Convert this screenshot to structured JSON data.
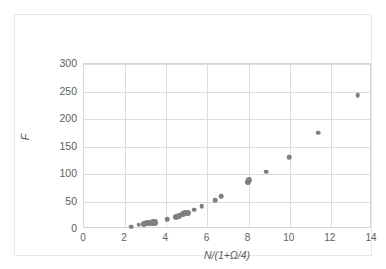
{
  "chart_data": {
    "type": "scatter",
    "title": "",
    "xlabel": "N/(1+Ω/4)",
    "ylabel": "F",
    "xlim": [
      0,
      14
    ],
    "ylim": [
      0,
      300
    ],
    "xticks": [
      0,
      2,
      4,
      6,
      8,
      10,
      12,
      14
    ],
    "yticks": [
      0,
      50,
      100,
      150,
      200,
      250,
      300
    ],
    "grid": true,
    "legend": "none",
    "marker_color": "#7f7f7f",
    "series": [
      {
        "name": "F vs N/(1+Ω/4)",
        "points": [
          {
            "x": 2.3,
            "y": 4
          },
          {
            "x": 2.65,
            "y": 8
          },
          {
            "x": 2.9,
            "y": 9
          },
          {
            "x": 3.05,
            "y": 11
          },
          {
            "x": 3.2,
            "y": 11
          },
          {
            "x": 3.35,
            "y": 12
          },
          {
            "x": 3.45,
            "y": 12
          },
          {
            "x": 4.05,
            "y": 18
          },
          {
            "x": 4.45,
            "y": 22
          },
          {
            "x": 4.62,
            "y": 24
          },
          {
            "x": 4.8,
            "y": 27
          },
          {
            "x": 4.92,
            "y": 29
          },
          {
            "x": 5.05,
            "y": 30
          },
          {
            "x": 5.35,
            "y": 35
          },
          {
            "x": 5.72,
            "y": 41
          },
          {
            "x": 6.38,
            "y": 52
          },
          {
            "x": 6.68,
            "y": 60
          },
          {
            "x": 7.98,
            "y": 85
          },
          {
            "x": 8.02,
            "y": 89
          },
          {
            "x": 8.85,
            "y": 104
          },
          {
            "x": 9.97,
            "y": 131
          },
          {
            "x": 11.38,
            "y": 175
          },
          {
            "x": 13.3,
            "y": 243
          }
        ]
      }
    ]
  },
  "axes": {
    "y_tick_labels": [
      "300",
      "250",
      "200",
      "150",
      "100",
      "50",
      "0"
    ],
    "x_tick_labels": [
      "0",
      "2",
      "4",
      "6",
      "8",
      "10",
      "12",
      "14"
    ],
    "y_title": "F",
    "x_title": "N/(1+Ω/4)"
  },
  "colors": {
    "marker": "#7f7f7f",
    "gridline": "#dcdcdc",
    "plot_border": "#d6d6d6",
    "outer_border": "#e8e8e8",
    "tick_text": "#606060",
    "axis_title_text": "#5a5a5a",
    "background": "#ffffff"
  }
}
